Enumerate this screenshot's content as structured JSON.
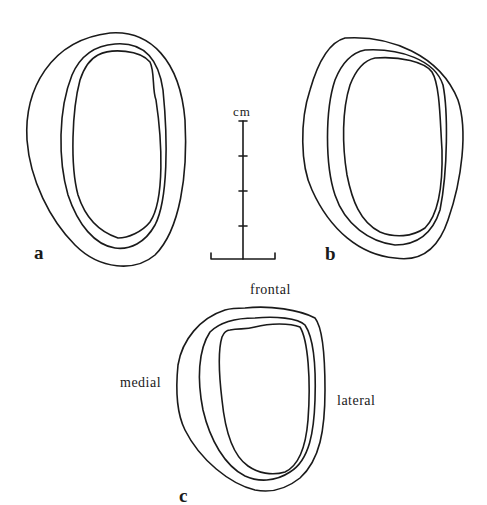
{
  "figure": {
    "panels": [
      {
        "id": "a",
        "label": "a"
      },
      {
        "id": "b",
        "label": "b"
      },
      {
        "id": "c",
        "label": "c"
      }
    ],
    "scale_bar": {
      "unit": "cm",
      "tick_count": 3
    },
    "orientation_labels": {
      "top": "frontal",
      "left": "medial",
      "right": "lateral"
    },
    "colors": {
      "line": "#1a1a1a",
      "background": "#ffffff"
    }
  }
}
